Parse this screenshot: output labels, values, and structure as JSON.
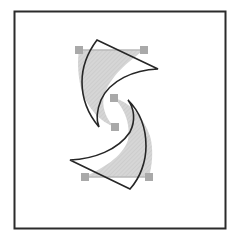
{
  "diagram": {
    "colors": {
      "background": "#ffffff",
      "frame": "#2b2b2b",
      "original_fill": "#d6d6d6",
      "outline": "#262626",
      "handle": "#a9a9a9",
      "guide": "#b8b8b8"
    },
    "frame": {
      "x": 14,
      "y": 11,
      "width": 212,
      "height": 218
    },
    "handles": [
      {
        "name": "top-left",
        "cx": 79,
        "cy": 50
      },
      {
        "name": "top-right",
        "cx": 144,
        "cy": 50
      },
      {
        "name": "middle-upper",
        "cx": 114,
        "cy": 98
      },
      {
        "name": "middle-lower",
        "cx": 115,
        "cy": 127
      },
      {
        "name": "bottom-left",
        "cx": 85,
        "cy": 177
      },
      {
        "name": "bottom-right",
        "cx": 149,
        "cy": 177
      }
    ]
  }
}
